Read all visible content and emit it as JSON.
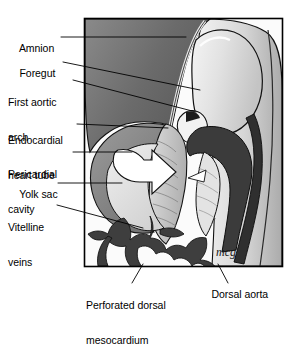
{
  "figure": {
    "title_caption": "",
    "domain": "embryology-diagram",
    "signature": "mcg",
    "frame": {
      "x": 84,
      "y": 18,
      "width": 199,
      "height": 249
    },
    "colors": {
      "line": "#000000",
      "text": "#000000",
      "background": "#ffffff",
      "amnion_fill": "#6e6e6e",
      "amnion_inner": "#4a4a4a",
      "pale_tissue": "#e4e4e4",
      "mid_tissue": "#b8b8b8",
      "dark_tissue": "#3a3a3a",
      "heart_tube_fill": "#c9c9c9",
      "arrow_fill": "#ffffff",
      "vitelline_fill": "#404040",
      "foregut_fill": "#efefef"
    }
  },
  "labels": {
    "left": [
      {
        "name": "amnion",
        "text": "Amnion",
        "lines": [
          "Amnion"
        ]
      },
      {
        "name": "foregut",
        "text": "Foregut",
        "lines": [
          "Foregut"
        ]
      },
      {
        "name": "first-aortic-arch",
        "text": "First aortic arch",
        "lines": [
          "First aortic",
          "arch"
        ]
      },
      {
        "name": "endocardial-heart-tube",
        "text": "Endocardial heart tube",
        "lines": [
          "Endocardial",
          "heart tube"
        ]
      },
      {
        "name": "pericardial-cavity",
        "text": "Pericardial cavity",
        "lines": [
          "Pericardial",
          "cavity"
        ]
      },
      {
        "name": "yolk-sac",
        "text": "Yolk sac",
        "lines": [
          "Yolk sac"
        ]
      },
      {
        "name": "vitelline-veins",
        "text": "Vitelline veins",
        "lines": [
          "Vitelline",
          "veins"
        ]
      }
    ],
    "bottom": [
      {
        "name": "perforated-dorsal-mesocardium",
        "text": "Perforated dorsal mesocardium",
        "lines": [
          "Perforated dorsal",
          "mesocardium"
        ]
      },
      {
        "name": "dorsal-aorta",
        "text": "Dorsal aorta",
        "lines": [
          "Dorsal aorta"
        ]
      }
    ]
  },
  "text": {
    "amnion_l1": "Amnion",
    "foregut_l1": "Foregut",
    "aortic_l1": "First aortic",
    "aortic_l2": "arch",
    "endo_l1": "Endocardial",
    "endo_l2": "heart tube",
    "peri_l1": "Pericardial",
    "peri_l2": "cavity",
    "yolk_l1": "Yolk sac",
    "vit_l1": "Vitelline",
    "vit_l2": "veins",
    "perf_l1": "Perforated dorsal",
    "perf_l2": "mesocardium",
    "aorta_l1": "Dorsal aorta"
  }
}
